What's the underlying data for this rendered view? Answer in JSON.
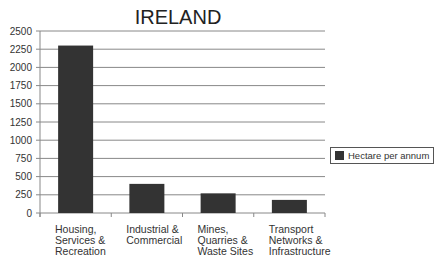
{
  "chart_data": {
    "type": "bar",
    "title": "IRELAND",
    "categories": [
      "Housing, Services & Recreation",
      "Industrial & Commercial",
      "Mines, Quarries & Waste Sites",
      "Transport Networks & Infrastructure"
    ],
    "category_lines": [
      [
        "Housing,",
        "Services &",
        "Recreation"
      ],
      [
        "Industrial &",
        "Commercial"
      ],
      [
        "Mines,",
        "Quarries &",
        "Waste Sites"
      ],
      [
        "Transport",
        "Networks &",
        "Infrastructure"
      ]
    ],
    "series": [
      {
        "name": "Hectare per annum",
        "values": [
          2300,
          400,
          270,
          180
        ],
        "color": "#333333"
      }
    ],
    "xlabel": "",
    "ylabel": "",
    "ylim": [
      0,
      2500
    ],
    "yticks": [
      0,
      250,
      500,
      750,
      1000,
      1250,
      1500,
      1750,
      2000,
      2250,
      2500
    ],
    "grid": true,
    "legend_position": "right"
  }
}
